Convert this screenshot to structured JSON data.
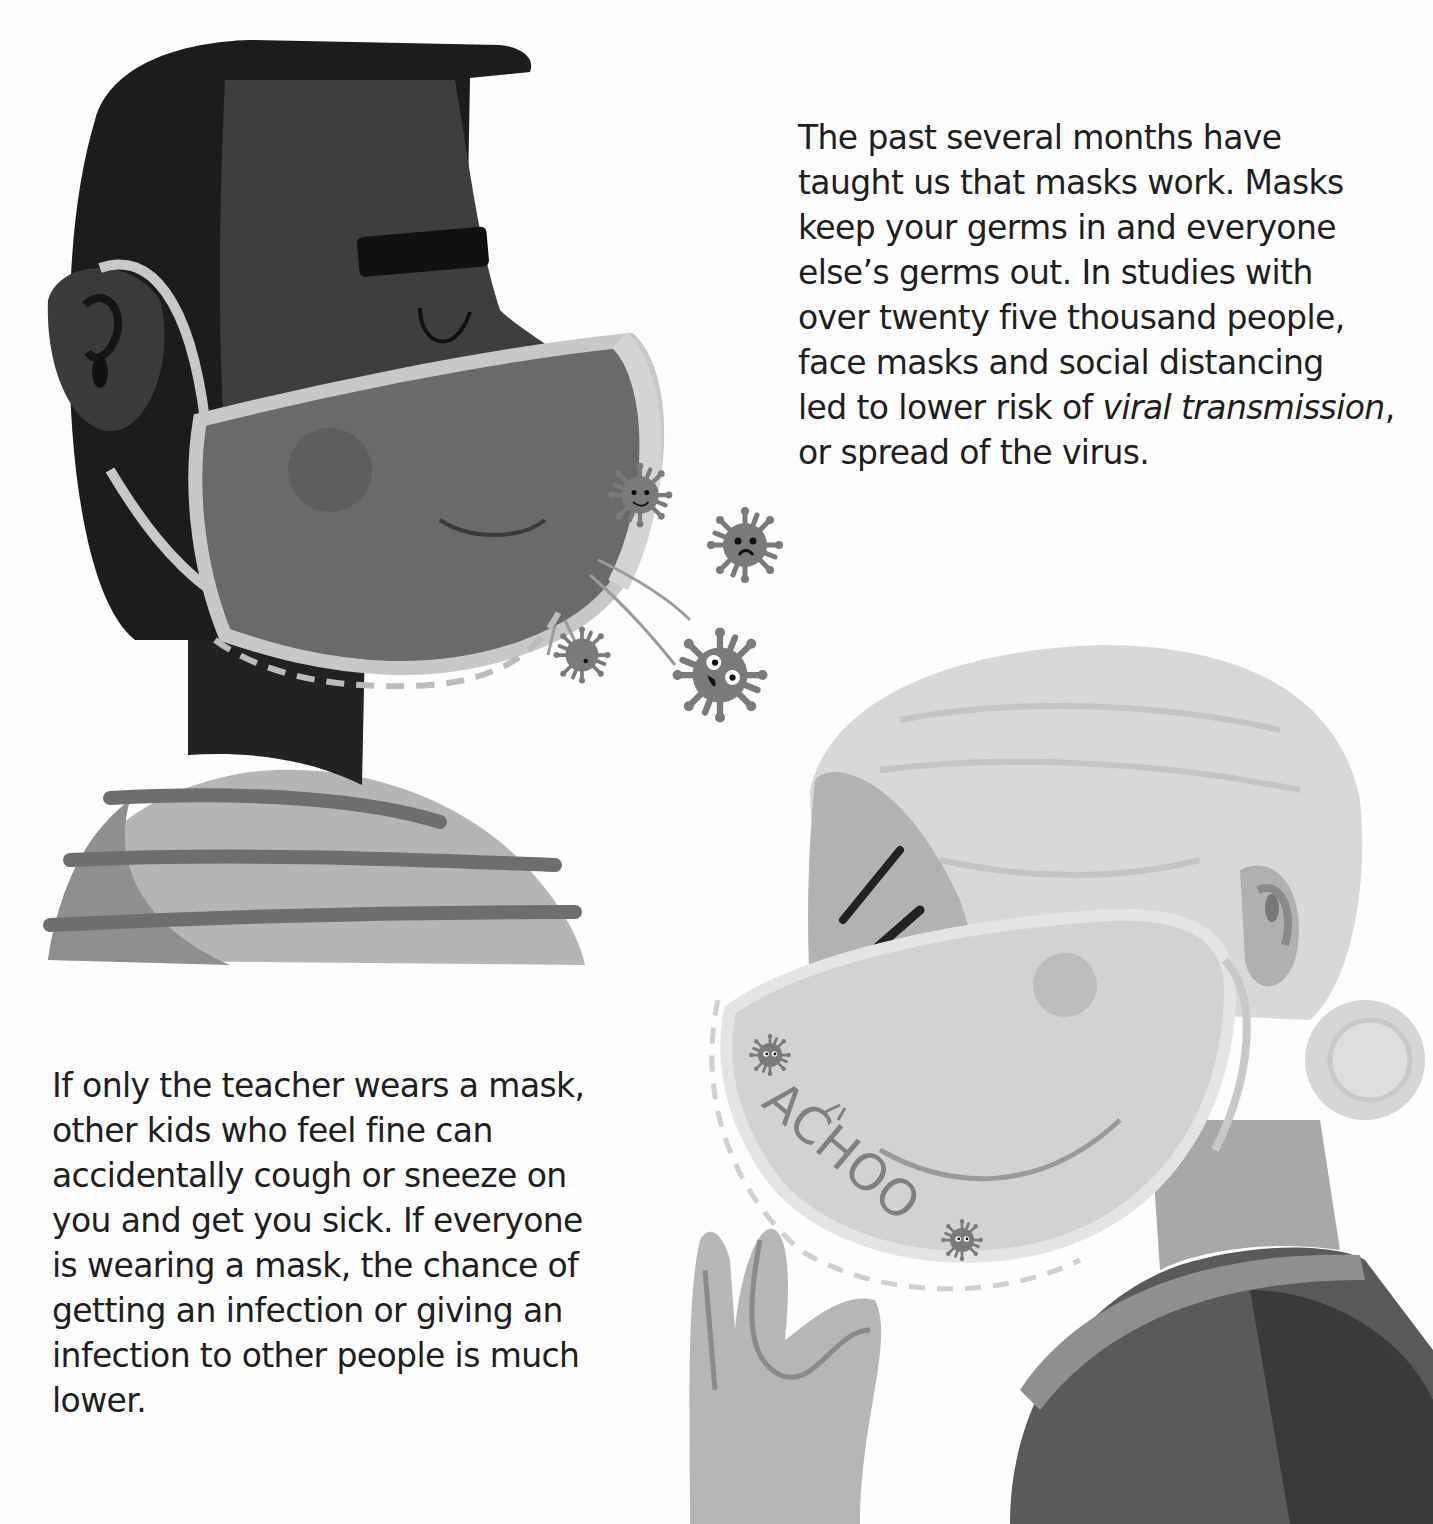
{
  "page": {
    "style": "grayscale children's book illustration",
    "colors": {
      "background": "#fdfdfd",
      "text": "#1e1e1e",
      "man_hair": "#1c1c1c",
      "man_skin": "#3e3e3e",
      "man_mask": "#6a6a6a",
      "mask_border": "#c8c8c8",
      "shirt_light": "#b5b5b5",
      "shirt_stripe": "#6e6e6e",
      "woman_hair": "#d8d8d8",
      "woman_skin": "#b0b0b0",
      "woman_mask": "#cfcfcf",
      "woman_sweater": "#4a4a4a",
      "virus": "#7a7a7a"
    }
  },
  "top_paragraph": {
    "lines": [
      "The past several months have",
      "taught us that masks work. Masks",
      "keep your germs in and everyone",
      "else’s germs out.  In studies with",
      "over twenty five thousand people,",
      "face masks and social distancing"
    ],
    "line7_prefix": "led to lower risk of ",
    "line7_italic": "viral transmission",
    "line7_suffix": ",",
    "line8": "or spread of the virus."
  },
  "bottom_paragraph": {
    "lines": [
      "If only the teacher wears a mask,",
      "other kids who feel fine can",
      "accidentally cough or sneeze on",
      "you and get you sick. If everyone",
      "is wearing a mask, the chance of",
      "getting an infection or giving an",
      "infection to other people is much",
      "lower."
    ]
  },
  "illustration": {
    "sneeze_text": "ACHOO",
    "figures": [
      "masked-man-profile",
      "masked-woman-sneezing"
    ],
    "icons": [
      "virus-icon",
      "virus-icon",
      "virus-icon",
      "virus-icon",
      "virus-icon",
      "virus-icon"
    ]
  }
}
